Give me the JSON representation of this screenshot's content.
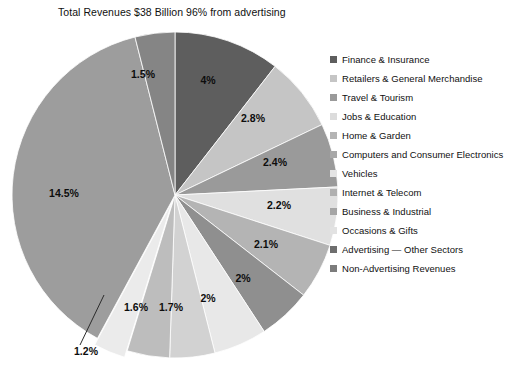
{
  "chart": {
    "title": "Total Revenues $38 Billion 96% from advertising"
  },
  "caption": {
    "text": ""
  },
  "chart_data": {
    "type": "pie",
    "title": "Total Revenues $38 Billion 96% from advertising",
    "xlabel": "",
    "ylabel": "",
    "legend_position": "right",
    "grid": false,
    "units": "percent of total revenues",
    "total_note": "Total Revenues $38 Billion 96% from advertising",
    "categories": [
      "Finance & Insurance",
      "Retailers & General Merchandise",
      "Travel & Tourism",
      "Jobs & Education",
      "Home & Garden",
      "Computers and Consumer Electronics",
      "Vehicles",
      "Internet & Telecom",
      "Business & Industrial",
      "Occasions & Gifts",
      "Advertising — Other Sectors",
      "Non-Advertising Revenues"
    ],
    "values": [
      4,
      2.8,
      2.4,
      2.2,
      2.1,
      2,
      2,
      1.7,
      1.6,
      1.2,
      14.5,
      1.5
    ],
    "labels": [
      "4%",
      "2.8%",
      "2.4%",
      "2.2%",
      "2.1%",
      "2%",
      "2%",
      "1.7%",
      "1.6%",
      "1.2%",
      "14.5%",
      "1.5%"
    ],
    "colors": [
      "#5e5e5e",
      "#c5c5c5",
      "#9a9a9a",
      "#e0e0e0",
      "#b4b4b4",
      "#8f8f8f",
      "#e8e8e8",
      "#d2d2d2",
      "#bdbdbd",
      "#ebebeb",
      "#9d9d9d",
      "#858585"
    ],
    "exploded": [
      "Occasions & Gifts"
    ]
  },
  "legend": {
    "items": [
      {
        "label": "Finance & Insurance",
        "color": "#5e5e5e"
      },
      {
        "label": "Retailers & General Merchandise",
        "color": "#c5c5c5"
      },
      {
        "label": "Travel & Tourism",
        "color": "#9a9a9a"
      },
      {
        "label": "Jobs & Education",
        "color": "#dcdcdc"
      },
      {
        "label": "Home & Garden",
        "color": "#b4b4b4"
      },
      {
        "label": "Computers and Consumer Electronics",
        "color": "#a8a8a8"
      },
      {
        "label": "Vehicles",
        "color": "#e4e4e4"
      },
      {
        "label": "Internet & Telecom",
        "color": "#b0b0b0"
      },
      {
        "label": "Business & Industrial",
        "color": "#a5a5a5"
      },
      {
        "label": "Occasions & Gifts",
        "color": "#e2e2e2"
      },
      {
        "label": "Advertising — Other Sectors",
        "color": "#6e6e6e"
      },
      {
        "label": "Non-Advertising Revenues",
        "color": "#7c7c7c"
      }
    ]
  },
  "slice_label_positions": [
    {
      "text": "4%",
      "x": 208,
      "y": 84
    },
    {
      "text": "2.8%",
      "x": 253,
      "y": 122
    },
    {
      "text": "2.4%",
      "x": 275,
      "y": 166
    },
    {
      "text": "2.2%",
      "x": 279,
      "y": 209
    },
    {
      "text": "2.1%",
      "x": 266,
      "y": 248
    },
    {
      "text": "2%",
      "x": 243,
      "y": 282
    },
    {
      "text": "2%",
      "x": 208,
      "y": 302
    },
    {
      "text": "1.7%",
      "x": 171,
      "y": 311
    },
    {
      "text": "1.6%",
      "x": 136,
      "y": 311
    },
    {
      "text": "1.2%",
      "x": 86,
      "y": 355
    },
    {
      "text": "14.5%",
      "x": 64,
      "y": 197
    },
    {
      "text": "1.5%",
      "x": 143,
      "y": 78
    }
  ]
}
